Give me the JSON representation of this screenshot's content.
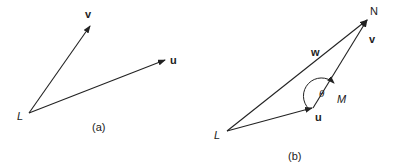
{
  "figure_a": {
    "caption": "(a)",
    "point_L": "L",
    "vector_v": "v",
    "vector_u": "u"
  },
  "figure_b": {
    "caption": "(b)",
    "point_L": "L",
    "point_M": "M",
    "point_N": "N",
    "vector_u": "u",
    "vector_v": "v",
    "vector_w": "w",
    "angle": "θ"
  },
  "colors": {
    "stroke": "#222222",
    "background": "#ffffff"
  }
}
